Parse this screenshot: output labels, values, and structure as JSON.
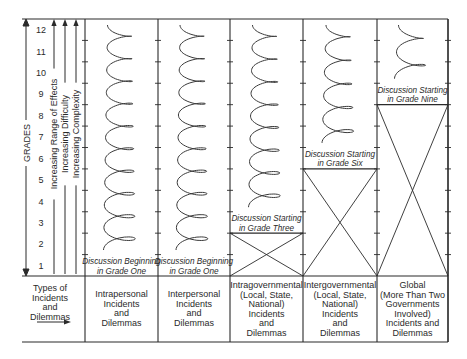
{
  "axis": {
    "title": "GRADES",
    "grades": [
      "1",
      "2",
      "3",
      "4",
      "5",
      "6",
      "7",
      "8",
      "9",
      "10",
      "11",
      "12"
    ],
    "arrows": [
      "Increasing Range of Effects",
      "Increasing Difficulty",
      "Increasing Complexity"
    ]
  },
  "row_header": [
    "Types of",
    "Incidents",
    "and",
    "Dilemmas"
  ],
  "columns": [
    {
      "start_grade": 1,
      "caption": [
        "Discussion Beginning",
        "in Grade One"
      ],
      "label": [
        "Intrapersonal",
        "Incidents",
        "and",
        "Dilemmas"
      ]
    },
    {
      "start_grade": 1,
      "caption": [
        "Discussion Beginning",
        "in Grade One"
      ],
      "label": [
        "Interpersonal",
        "Incidents",
        "and",
        "Dilemmas"
      ]
    },
    {
      "start_grade": 3,
      "caption": [
        "Discussion Starting",
        "in Grade Three"
      ],
      "label": [
        "Intragovernmental",
        "(Local, State,",
        "National)",
        "Incidents",
        "and",
        "Dilemmas"
      ]
    },
    {
      "start_grade": 6,
      "caption": [
        "Discussion Starting",
        "in Grade Six"
      ],
      "label": [
        "Intergovernmental",
        "(Local, State,",
        "National)",
        "Incidents",
        "and",
        "Dilemmas"
      ]
    },
    {
      "start_grade": 9,
      "caption": [
        "Discussion Starting",
        "in Grade Nine"
      ],
      "label": [
        "Global",
        "(More Than Two",
        "Governments",
        "Involved)",
        "Incidents and",
        "Dilemmas"
      ]
    }
  ]
}
